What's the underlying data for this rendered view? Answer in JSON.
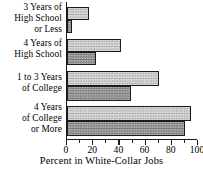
{
  "chart_data": {
    "type": "bar",
    "orientation": "horizontal",
    "title": "",
    "xlabel": "Percent in White-Collar Jobs",
    "ylabel": "",
    "xlim": [
      0,
      100
    ],
    "xticks": [
      0,
      20,
      40,
      60,
      80,
      100
    ],
    "xtick_labels": [
      "0",
      "20",
      "40",
      "60",
      "80",
      "100"
    ],
    "minor_xticks": [
      10,
      30,
      50,
      70,
      90
    ],
    "grid": false,
    "legend": "none",
    "categories": [
      "3 Years of High School or Less",
      "4 Years of High School",
      "1 to 3 Years of College",
      "4 Years of College or More"
    ],
    "category_label_lines": [
      [
        "3 Years of",
        "High School",
        "or Less"
      ],
      [
        "4 Years of",
        "High School"
      ],
      [
        "1 to 3 Years",
        "of  College"
      ],
      [
        "4 Years",
        "of College",
        "or More"
      ]
    ],
    "series": [
      {
        "name": "light",
        "fill": "light",
        "values": [
          17,
          41,
          70,
          95
        ]
      },
      {
        "name": "dark",
        "fill": "dark",
        "values": [
          4,
          22,
          49,
          90
        ]
      }
    ],
    "colors": {
      "light_fill": "#cdcdcd",
      "dark_fill": "#a0a0a0",
      "outline": "#1c1c1c",
      "axis": "#1a1a1a",
      "background": "#ffffff",
      "text": "#000000"
    }
  }
}
